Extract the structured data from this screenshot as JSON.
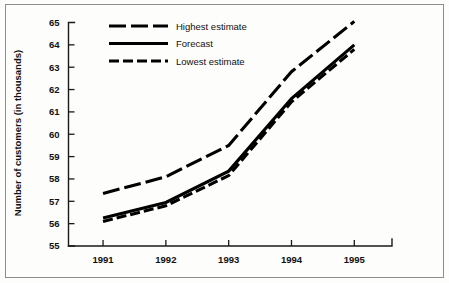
{
  "chart_data": {
    "type": "line",
    "title": "",
    "xlabel": "",
    "ylabel": "Number of customers (in thousands)",
    "categories": [
      "1991",
      "1992",
      "1993",
      "1994",
      "1995"
    ],
    "x": [
      1991,
      1992,
      1993,
      1994,
      1995
    ],
    "xlim": [
      1990.45,
      1995.6
    ],
    "ylim": [
      55,
      65
    ],
    "yticks": [
      55,
      56,
      57,
      58,
      59,
      60,
      61,
      62,
      63,
      64,
      65
    ],
    "ytick_labels": [
      "55",
      "56",
      "57",
      "58",
      "59",
      "60",
      "61",
      "62",
      "63",
      "64",
      "65"
    ],
    "grid": false,
    "legend_position": "top-left-inside",
    "series": [
      {
        "name": "Highest estimate",
        "style": "long-dash",
        "dash_pattern": "17,5",
        "values": [
          57.35,
          58.1,
          59.5,
          62.8,
          65.05
        ]
      },
      {
        "name": "Forecast",
        "style": "solid",
        "dash_pattern": "none",
        "values": [
          56.25,
          56.95,
          58.35,
          61.6,
          64.0
        ]
      },
      {
        "name": "Lowest estimate",
        "style": "medium-dash",
        "dash_pattern": "10,4",
        "values": [
          56.1,
          56.8,
          58.15,
          61.45,
          63.8
        ]
      }
    ]
  },
  "legend": {
    "entries": [
      {
        "label": "Highest estimate"
      },
      {
        "label": "Forecast"
      },
      {
        "label": "Lowest estimate"
      }
    ]
  },
  "colors": {
    "line": "#000000",
    "axis": "#1a1a1a",
    "text": "#111111",
    "background": "#fdfdfb",
    "frame": "#8d8d8d"
  }
}
